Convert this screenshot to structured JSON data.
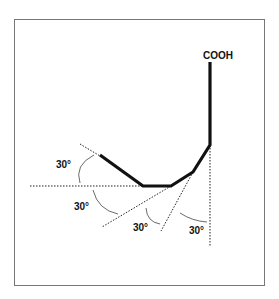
{
  "diagram": {
    "chain_label": "COOH",
    "angle_labels": [
      "30°",
      "30°",
      "30°",
      "30°"
    ],
    "colors": {
      "frame": "#777777",
      "bond": "#111111",
      "guide": "#222222",
      "arc": "#444444"
    }
  }
}
